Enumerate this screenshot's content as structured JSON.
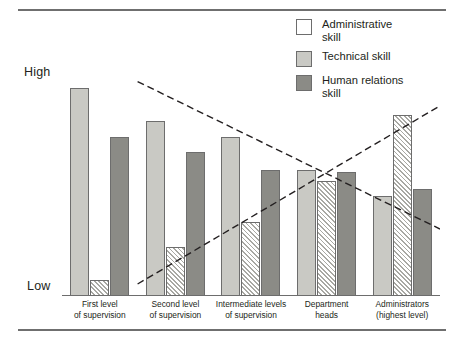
{
  "figure": {
    "rules": [
      "top-rule",
      "bottom-rule"
    ]
  },
  "axis": {
    "y_high_label": "High",
    "y_low_label": "Low"
  },
  "legend": {
    "position": "top-right",
    "items": [
      {
        "key": "administrative",
        "label": "Administrative\nskill",
        "swatch": "diagonal-hatch",
        "color": "#ffffff"
      },
      {
        "key": "technical",
        "label": "Technical skill",
        "swatch": "light-fill",
        "color": "#c9c9c4"
      },
      {
        "key": "human",
        "label": "Human relations\nskill",
        "swatch": "dark-fill",
        "color": "#8b8b86"
      }
    ]
  },
  "chart_data": {
    "type": "bar",
    "title": "",
    "xlabel": "",
    "ylabel": "",
    "ylim": [
      0,
      100
    ],
    "grid": false,
    "legend_position": "top-right",
    "categories": [
      "First level\nof supervision",
      "Second level\nof supervision",
      "Intermediate levels\nof supervision",
      "Department\nheads",
      "Administrators\n(highest level)"
    ],
    "tick_labels": [
      "Low",
      "High"
    ],
    "series": [
      {
        "name": "Technical skill",
        "color": "#c9c9c4",
        "pattern": "solid-light",
        "values": [
          94,
          79,
          72,
          57,
          45
        ]
      },
      {
        "name": "Administrative skill",
        "color": "#ffffff",
        "pattern": "diagonal-hatch",
        "values": [
          7,
          22,
          33,
          52,
          82
        ]
      },
      {
        "name": "Human relations skill",
        "color": "#8b8b86",
        "pattern": "solid-dark",
        "values": [
          72,
          65,
          57,
          56,
          48
        ]
      }
    ],
    "annotations": [
      {
        "name": "technical-trend-line",
        "style": "dashed",
        "from": [
          0.5,
          97
        ],
        "to": [
          4.5,
          30
        ]
      },
      {
        "name": "administrative-trend-line",
        "style": "dashed",
        "from": [
          0.5,
          5
        ],
        "to": [
          4.5,
          86
        ]
      }
    ]
  },
  "groups": [
    {
      "category": "First level\nof supervision",
      "bars": [
        {
          "series": "technical",
          "value": 94
        },
        {
          "series": "admin",
          "value": 7
        },
        {
          "series": "human",
          "value": 72
        }
      ]
    },
    {
      "category": "Second level\nof supervision",
      "bars": [
        {
          "series": "technical",
          "value": 79
        },
        {
          "series": "admin",
          "value": 22
        },
        {
          "series": "human",
          "value": 65
        }
      ]
    },
    {
      "category": "Intermediate levels\nof supervision",
      "bars": [
        {
          "series": "technical",
          "value": 72
        },
        {
          "series": "admin",
          "value": 33
        },
        {
          "series": "human",
          "value": 57
        }
      ]
    },
    {
      "category": "Department\nheads",
      "bars": [
        {
          "series": "technical",
          "value": 57
        },
        {
          "series": "admin",
          "value": 52
        },
        {
          "series": "human",
          "value": 56
        }
      ]
    },
    {
      "category": "Administrators\n(highest level)",
      "bars": [
        {
          "series": "technical",
          "value": 45
        },
        {
          "series": "admin",
          "value": 82
        },
        {
          "series": "human",
          "value": 48
        }
      ]
    }
  ]
}
